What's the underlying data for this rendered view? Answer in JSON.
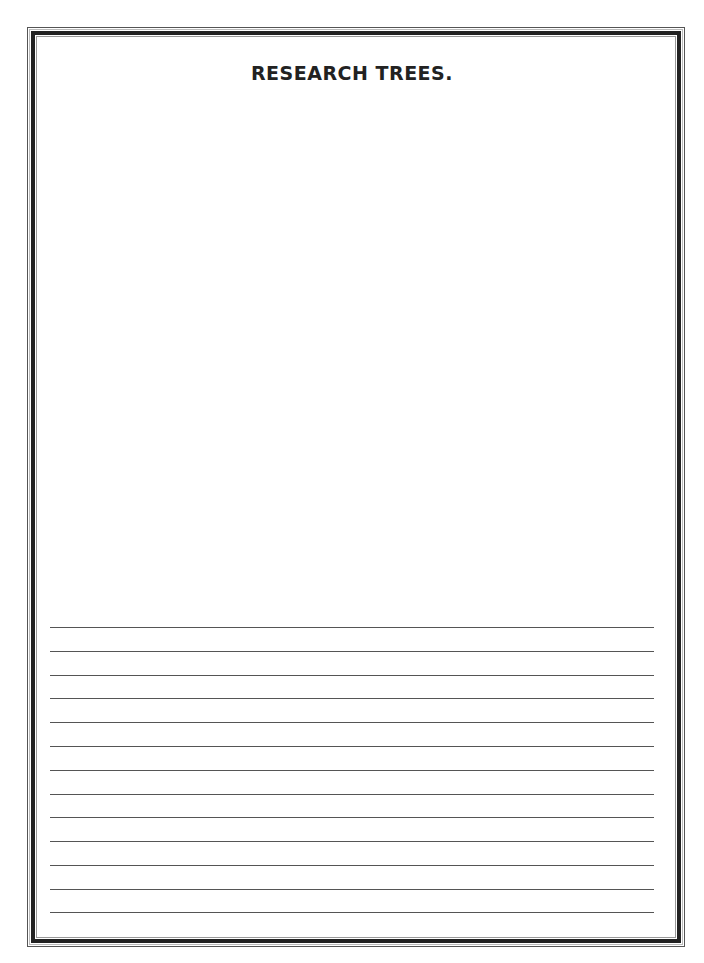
{
  "page": {
    "title": "RESEARCH TREES.",
    "drawing_area": "blank drawing space",
    "writing_lines": {
      "count": 13,
      "lines": [
        "",
        "",
        "",
        "",
        "",
        "",
        "",
        "",
        "",
        "",
        "",
        "",
        ""
      ]
    }
  }
}
